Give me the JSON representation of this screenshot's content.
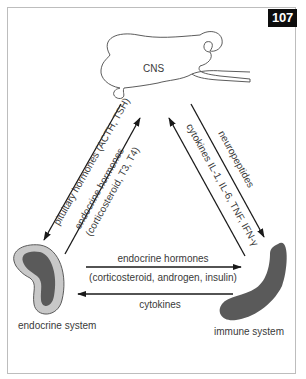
{
  "figure": {
    "number": "107",
    "colors": {
      "frame": "#bdbdbd",
      "badge_bg": "#0d0d0d",
      "badge_text": "#ffffff",
      "arrow": "#1a1a1a",
      "text": "#3a3a3a",
      "organ_dark": "#5a5a5a",
      "organ_light": "#c8c8c8"
    }
  },
  "nodes": {
    "cns": {
      "label": "CNS"
    },
    "endocrine": {
      "label": "endocrine system"
    },
    "immune": {
      "label": "immune system"
    }
  },
  "edges": {
    "cns_to_endocrine": {
      "label": "pituitary hormones (ACTH, TSH)"
    },
    "endocrine_to_cns": {
      "line1": "endocrine hormones",
      "line2": "(corticosteroid, T3, T4)"
    },
    "cns_to_immune": {
      "label": "neuropeptides"
    },
    "immune_to_cns": {
      "label": "cytokines IL-1, IL-6, TNF, IFN-γ"
    },
    "endocrine_to_immune": {
      "line1": "endocrine hormones",
      "line2": "(corticosteroid, androgen, insulin)"
    },
    "immune_to_endocrine": {
      "label": "cytokines"
    }
  }
}
